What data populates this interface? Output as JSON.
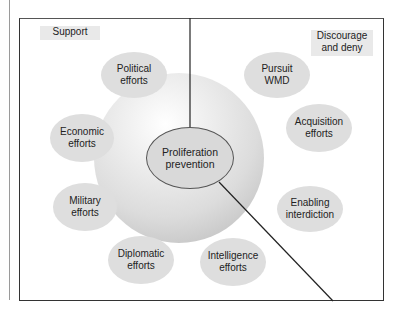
{
  "diagram": {
    "regions": {
      "support": "Support",
      "discourage_line1": "Discourage",
      "discourage_line2": "and deny"
    },
    "center": {
      "line1": "Proliferation",
      "line2": "prevention"
    },
    "bubbles": [
      {
        "id": "political",
        "line1": "Political",
        "line2": "efforts"
      },
      {
        "id": "pursuit",
        "line1": "Pursuit",
        "line2": "WMD"
      },
      {
        "id": "economic",
        "line1": "Economic",
        "line2": "efforts"
      },
      {
        "id": "acquisition",
        "line1": "Acquisition",
        "line2": "efforts"
      },
      {
        "id": "military",
        "line1": "Military",
        "line2": "efforts"
      },
      {
        "id": "enabling",
        "line1": "Enabling",
        "line2": "interdiction"
      },
      {
        "id": "diplomatic",
        "line1": "Diplomatic",
        "line2": "efforts"
      },
      {
        "id": "intelligence",
        "line1": "Intelligence",
        "line2": "efforts"
      }
    ],
    "colors": {
      "bubble": "#dedede",
      "frame": "#333333",
      "label_bg": "#e9e9e9"
    }
  }
}
